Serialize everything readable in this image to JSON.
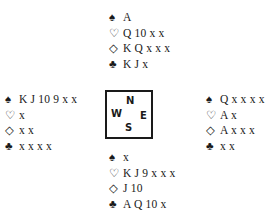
{
  "diagram": {
    "type": "bridge-deal",
    "suit_symbols": {
      "spades": "♠",
      "hearts": "♡",
      "diamonds": "◇",
      "clubs": "♣"
    },
    "compass": {
      "north": "N",
      "west": "W",
      "east": "E",
      "south": "S"
    },
    "hands": {
      "north": {
        "spades": "A",
        "hearts": "Q 10 x x",
        "diamonds": "K Q x x x",
        "clubs": "K J x"
      },
      "west": {
        "spades": "K J 10 9 x x",
        "hearts": "x",
        "diamonds": "x x",
        "clubs": "x x x x"
      },
      "east": {
        "spades": "Q x x x x",
        "hearts": "A x",
        "diamonds": "A x x x",
        "clubs": "x x"
      },
      "south": {
        "spades": "x",
        "hearts": "K J 9 x x x",
        "diamonds": "J 10",
        "clubs": "A Q 10 x"
      }
    }
  }
}
